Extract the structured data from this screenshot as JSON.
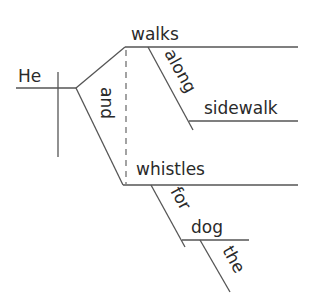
{
  "diagram": {
    "type": "sentence-diagram",
    "subject": "He",
    "conjunction": "and",
    "predicates": [
      {
        "verb": "walks",
        "modifiers": [
          {
            "preposition": "along",
            "object": "sidewalk"
          }
        ]
      },
      {
        "verb": "whistles",
        "modifiers": [
          {
            "preposition": "for",
            "object": "dog",
            "object_modifier": "the"
          }
        ]
      }
    ],
    "colors": {
      "line": "#555555",
      "text": "#2a2a2a",
      "background": "#ffffff"
    }
  }
}
